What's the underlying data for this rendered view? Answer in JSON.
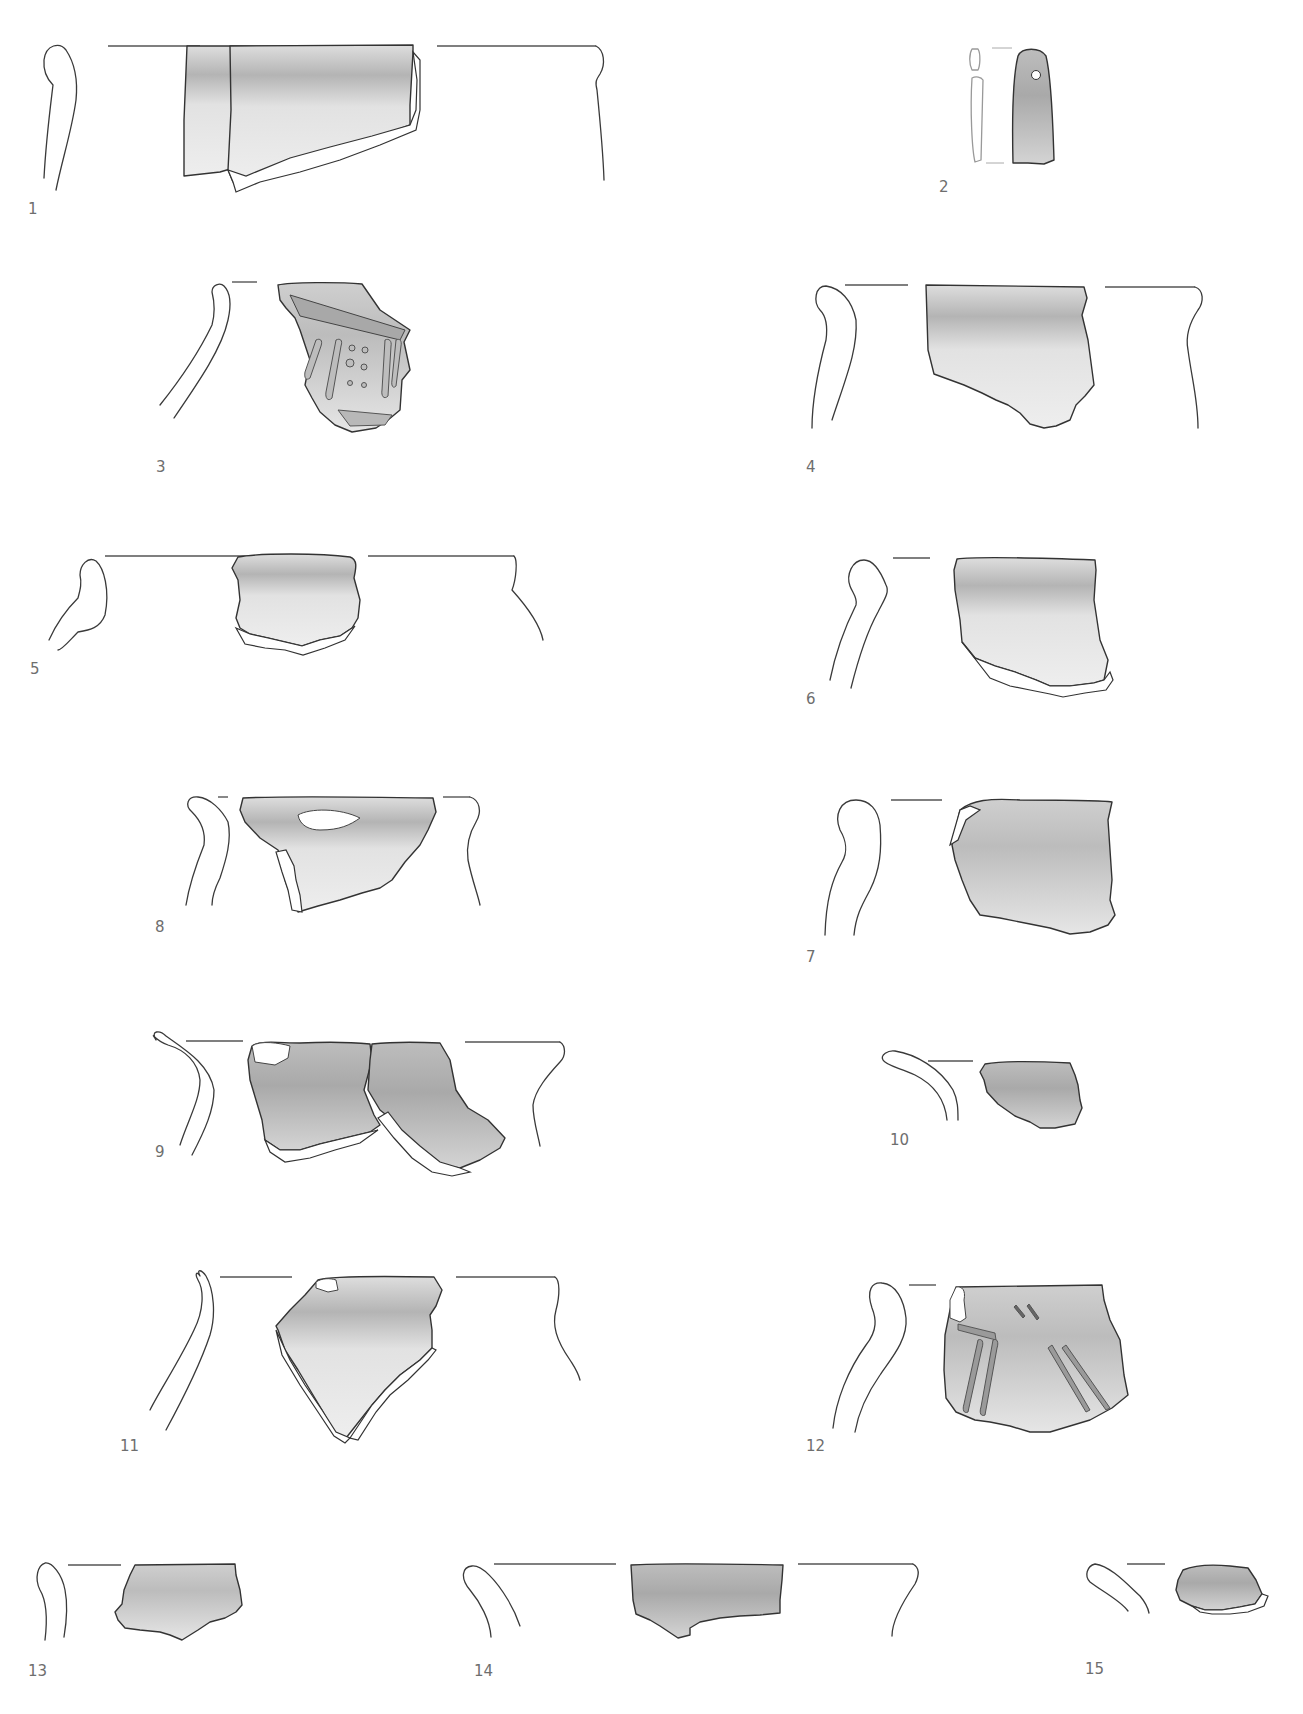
{
  "plate": {
    "type": "archaeological pottery drawing plate",
    "figures": [
      {
        "number": "1",
        "label_pos": [
          28,
          200
        ],
        "kind": "rim sherd with profile"
      },
      {
        "number": "2",
        "label_pos": [
          939,
          180
        ],
        "kind": "perforated pendant / whetstone"
      },
      {
        "number": "3",
        "label_pos": [
          158,
          458
        ],
        "kind": "decorated rim sherd (ribs and dots)"
      },
      {
        "number": "4",
        "label_pos": [
          806,
          458
        ],
        "kind": "rim sherd with profile"
      },
      {
        "number": "5",
        "label_pos": [
          30,
          660
        ],
        "kind": "rim sherd with profile"
      },
      {
        "number": "6",
        "label_pos": [
          806,
          690
        ],
        "kind": "rim sherd with profile"
      },
      {
        "number": "8",
        "label_pos": [
          155,
          918
        ],
        "kind": "rim sherd with profile"
      },
      {
        "number": "7",
        "label_pos": [
          806,
          948
        ],
        "kind": "rim sherd with profile"
      },
      {
        "number": "9",
        "label_pos": [
          155,
          1145
        ],
        "kind": "rim sherd (two joining fragments)"
      },
      {
        "number": "10",
        "label_pos": [
          890,
          1133
        ],
        "kind": "rim sherd with profile"
      },
      {
        "number": "11",
        "label_pos": [
          120,
          1438
        ],
        "kind": "rim sherd with profile"
      },
      {
        "number": "12",
        "label_pos": [
          806,
          1438
        ],
        "kind": "incised decorated rim sherd"
      },
      {
        "number": "13",
        "label_pos": [
          28,
          1662
        ],
        "kind": "rim sherd with profile"
      },
      {
        "number": "14",
        "label_pos": [
          474,
          1662
        ],
        "kind": "rim sherd with profile"
      },
      {
        "number": "15",
        "label_pos": [
          1085,
          1660
        ],
        "kind": "rim sherd with profile"
      }
    ],
    "colors": {
      "background": "#ffffff",
      "line": "#333333",
      "sherd_fill_light": "#e6e6e6",
      "sherd_fill_dark": "#a8a8a8",
      "label": "#6e6e6e"
    }
  }
}
